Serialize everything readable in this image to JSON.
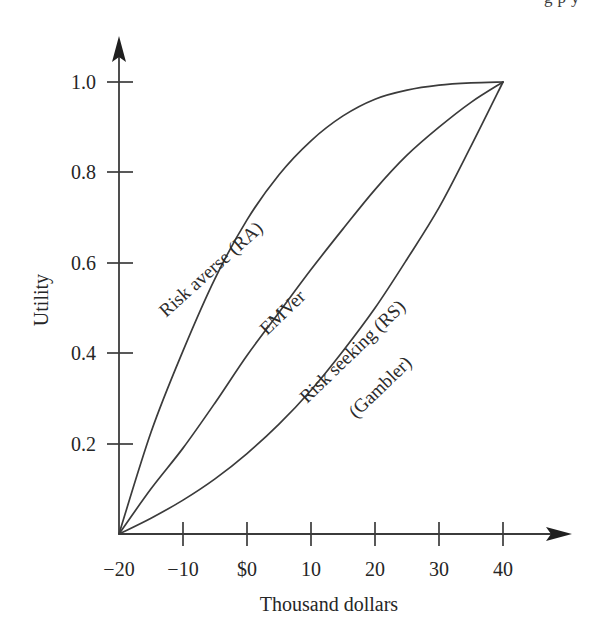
{
  "page": {
    "truncated_header_text": "g        p  y"
  },
  "chart_data": {
    "type": "line",
    "title": "",
    "xlabel": "Thousand dollars",
    "ylabel": "Utility",
    "xlim": [
      -20,
      45
    ],
    "ylim": [
      0,
      1.1
    ],
    "grid": false,
    "legend": "inline-labels",
    "xticks": [
      -20,
      -10,
      0,
      10,
      20,
      30,
      40
    ],
    "xtick_labels": [
      "−20",
      "−10",
      "$0",
      "10",
      "20",
      "30",
      "40"
    ],
    "yticks": [
      0.2,
      0.4,
      0.6,
      0.8,
      1.0
    ],
    "ytick_labels": [
      "0.2",
      "0.4",
      "0.6",
      "0.8",
      "1.0"
    ],
    "x": [
      -20,
      -15,
      -10,
      -5,
      0,
      5,
      10,
      15,
      20,
      25,
      30,
      35,
      40
    ],
    "series": [
      {
        "name": "Risk averse (RA)",
        "label": "Risk averse (RA)",
        "values": [
          0.0,
          0.225,
          0.405,
          0.565,
          0.695,
          0.795,
          0.87,
          0.925,
          0.962,
          0.982,
          0.993,
          0.998,
          1.0
        ]
      },
      {
        "name": "EMVer",
        "label": "EMVer",
        "values": [
          0.0,
          0.1,
          0.19,
          0.29,
          0.395,
          0.49,
          0.585,
          0.675,
          0.762,
          0.838,
          0.9,
          0.955,
          1.0
        ]
      },
      {
        "name": "Risk seeking (RS)",
        "label": "Risk seeking (RS)",
        "sublabel": "(Gambler)",
        "values": [
          0.0,
          0.035,
          0.075,
          0.122,
          0.178,
          0.243,
          0.318,
          0.405,
          0.5,
          0.608,
          0.722,
          0.858,
          1.0
        ]
      }
    ],
    "annotations": [
      {
        "text": "Risk averse (RA)",
        "series": "Risk averse (RA)"
      },
      {
        "text": "EMVer",
        "series": "EMVer"
      },
      {
        "text": "Risk seeking (RS)",
        "series": "Risk seeking (RS)"
      },
      {
        "text": "(Gambler)",
        "series": "Risk seeking (RS)"
      }
    ],
    "colors": {
      "curve": "#3b3b3b",
      "axis": "#3b3b3b",
      "text": "#262626",
      "background": "#ffffff"
    }
  }
}
